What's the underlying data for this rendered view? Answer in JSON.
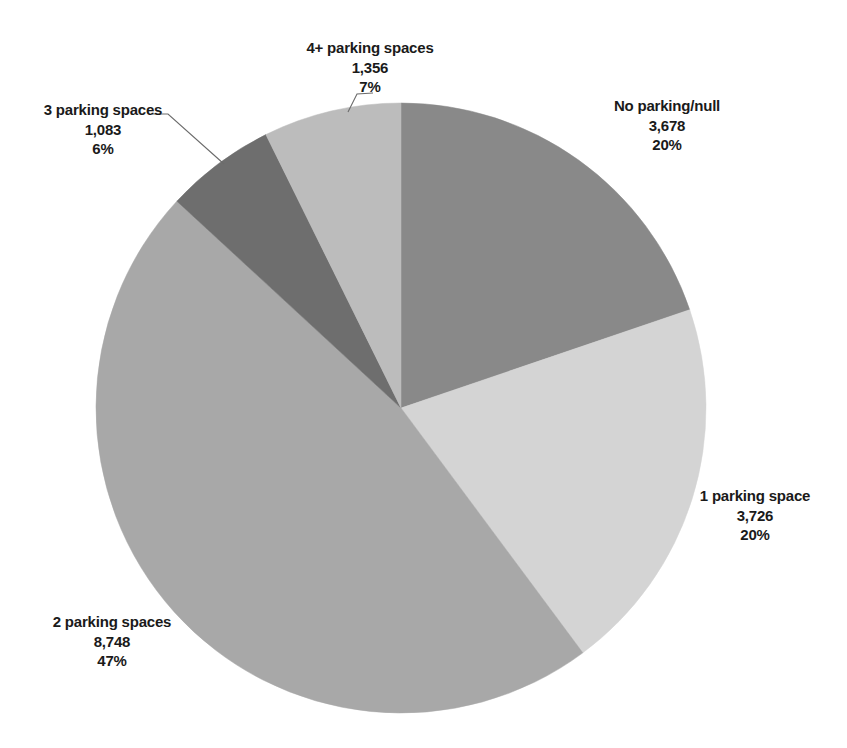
{
  "chart_data": {
    "type": "pie",
    "title": "",
    "subtitle": "",
    "xlabel": "",
    "ylabel": "",
    "legend_position": "none",
    "grid": false,
    "start_angle_deg": 0,
    "direction": "clockwise",
    "total": 18591,
    "categories": [
      "No parking/null",
      "1 parking space",
      "2 parking spaces",
      "3 parking spaces",
      "4+ parking spaces"
    ],
    "values": [
      3678,
      3726,
      8748,
      1083,
      1356
    ],
    "percent_labels": [
      "20%",
      "20%",
      "47%",
      "6%",
      "7%"
    ],
    "value_labels": [
      "3,678",
      "3,726",
      "8,748",
      "1,083",
      "1,356"
    ],
    "colors": [
      "#898989",
      "#d4d4d4",
      "#a8a8a8",
      "#6e6e6e",
      "#bcbcbc"
    ],
    "slices": [
      {
        "name": "No parking/null",
        "value": 3678,
        "value_label": "3,678",
        "percent_label": "20%",
        "percent": 19.8,
        "color": "#898989",
        "start_deg": 0,
        "end_deg": 71.2,
        "leader": false
      },
      {
        "name": "1 parking space",
        "value": 3726,
        "value_label": "3,726",
        "percent_label": "20%",
        "percent": 20.0,
        "color": "#d4d4d4",
        "start_deg": 71.2,
        "end_deg": 143.4,
        "leader": false
      },
      {
        "name": "2 parking spaces",
        "value": 8748,
        "value_label": "8,748",
        "percent_label": "47%",
        "percent": 47.1,
        "color": "#a8a8a8",
        "start_deg": 143.4,
        "end_deg": 312.7,
        "leader": false
      },
      {
        "name": "3 parking spaces",
        "value": 1083,
        "value_label": "1,083",
        "percent_label": "6%",
        "percent": 5.8,
        "color": "#6e6e6e",
        "start_deg": 312.7,
        "end_deg": 333.7,
        "leader": true
      },
      {
        "name": "4+ parking spaces",
        "value": 1356,
        "value_label": "1,356",
        "percent_label": "7%",
        "percent": 7.3,
        "color": "#bcbcbc",
        "start_deg": 333.7,
        "end_deg": 360,
        "leader": true
      }
    ],
    "geometry": {
      "center_x": 401,
      "center_y": 408,
      "radius": 305
    },
    "leader_lines": [
      {
        "for": "3 parking spaces",
        "points": "152,114 168,114 224,164"
      },
      {
        "for": "4+ parking spaces",
        "points": "373,93 357,94 348,112"
      }
    ]
  }
}
